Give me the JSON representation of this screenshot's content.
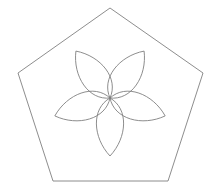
{
  "figure": {
    "background_color": "#ffffff",
    "stroke_color": "#808080",
    "stroke_width": 0.9,
    "width": 220,
    "height": 196
  },
  "chart_data": {
    "type": "diagram",
    "xlabel": "",
    "ylabel": "",
    "grid": false,
    "legend": false,
    "shapes": [
      {
        "name": "pentagon",
        "kind": "regular-polygon",
        "sides": 5,
        "center": [
          110,
          105
        ],
        "circumradius": 97,
        "rotation_deg": -90,
        "vertices": [
          [
            110,
            8
          ],
          [
            203,
            73
          ],
          [
            168,
            181
          ],
          [
            53,
            181
          ],
          [
            18,
            73
          ]
        ],
        "fill": "none",
        "stroke": "#808080"
      },
      {
        "name": "rosette",
        "kind": "petal-group",
        "petal_count": 5,
        "center": [
          110,
          98
        ],
        "petal_length": 58,
        "petal_half_width": 17,
        "base_angle_deg": -126,
        "angle_step_deg": 72,
        "petal_tip_angles_deg": [
          -126,
          -54,
          18,
          90,
          162
        ],
        "petal_tips": [
          [
            76,
            51
          ],
          [
            144,
            51
          ],
          [
            165,
            116
          ],
          [
            110,
            156
          ],
          [
            55,
            116
          ]
        ],
        "fill": "none",
        "stroke": "#808080"
      }
    ]
  }
}
